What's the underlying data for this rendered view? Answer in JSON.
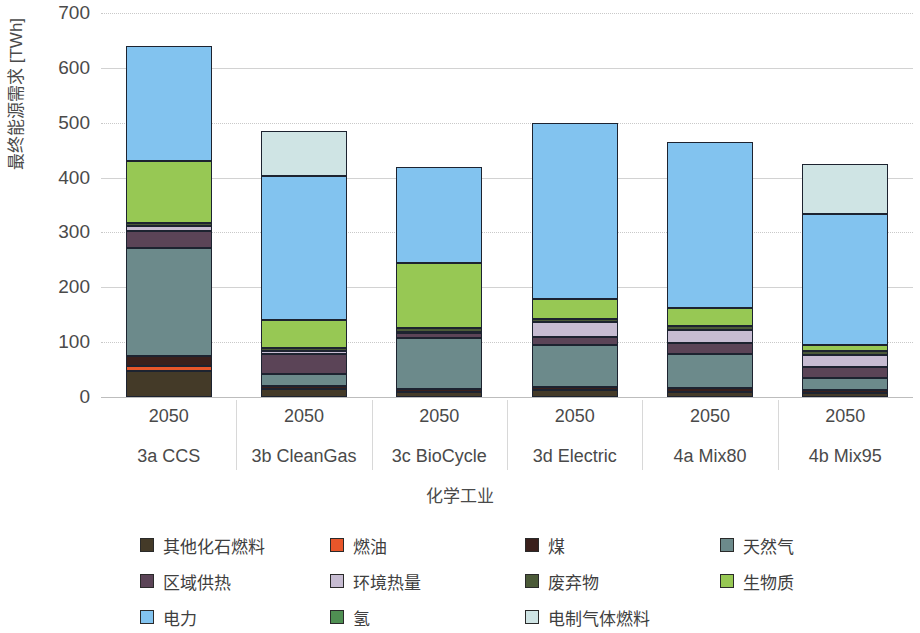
{
  "chart_data": {
    "type": "bar",
    "stacked": true,
    "title": "",
    "xlabel": "化学工业",
    "ylabel": "最终能源需求 [TWh]",
    "ylim": [
      0,
      700
    ],
    "ytick_step": 100,
    "yticks": [
      "700",
      "600",
      "500",
      "400",
      "300",
      "200",
      "100",
      "0"
    ],
    "grid": true,
    "legend_position": "bottom",
    "categories": [
      "3a CCS",
      "3b CleanGas",
      "3c BioCycle",
      "3d Electric",
      "4a Mix80",
      "4b Mix95"
    ],
    "category_years": [
      "2050",
      "2050",
      "2050",
      "2050",
      "2050",
      "2050"
    ],
    "series": [
      {
        "name": "其他化石燃料",
        "key": "other_fossil",
        "color": "#443a28",
        "values": [
          48,
          15,
          10,
          12,
          10,
          8
        ]
      },
      {
        "name": "燃油",
        "key": "fuel_oil",
        "color": "#e8562a",
        "values": [
          9,
          0,
          0,
          0,
          0,
          0
        ]
      },
      {
        "name": "煤",
        "key": "coal",
        "color": "#3a201c",
        "values": [
          18,
          5,
          5,
          7,
          6,
          5
        ]
      },
      {
        "name": "天然气",
        "key": "natural_gas",
        "color": "#6c8a8b",
        "values": [
          196,
          22,
          92,
          75,
          62,
          22
        ]
      },
      {
        "name": "区域供热",
        "key": "district_heat",
        "color": "#5b4457",
        "values": [
          31,
          36,
          10,
          16,
          20,
          19
        ]
      },
      {
        "name": "环境热量",
        "key": "ambient_heat",
        "color": "#c7bcd2",
        "values": [
          9,
          6,
          2,
          26,
          25,
          23
        ]
      },
      {
        "name": "废弃物",
        "key": "waste",
        "color": "#4b5a38",
        "values": [
          7,
          6,
          7,
          6,
          6,
          6
        ]
      },
      {
        "name": "生物质",
        "key": "biomass",
        "color": "#97c854",
        "values": [
          113,
          50,
          119,
          36,
          33,
          12
        ]
      },
      {
        "name": "电力",
        "key": "electricity",
        "color": "#82c3ef",
        "values": [
          209,
          262,
          175,
          321,
          302,
          239
        ]
      },
      {
        "name": "氢",
        "key": "hydrogen",
        "color": "#4f8f52",
        "values": [
          0,
          0,
          0,
          0,
          0,
          0
        ]
      },
      {
        "name": "电制气体燃料",
        "key": "e_gas",
        "color": "#cfe4e4",
        "values": [
          0,
          83,
          0,
          0,
          0,
          91
        ]
      }
    ],
    "totals": [
      640,
      485,
      420,
      497,
      464,
      425
    ]
  },
  "axis": {
    "ylabel": "最终能源需求 [TWh]",
    "xtitle": "化学工业"
  }
}
